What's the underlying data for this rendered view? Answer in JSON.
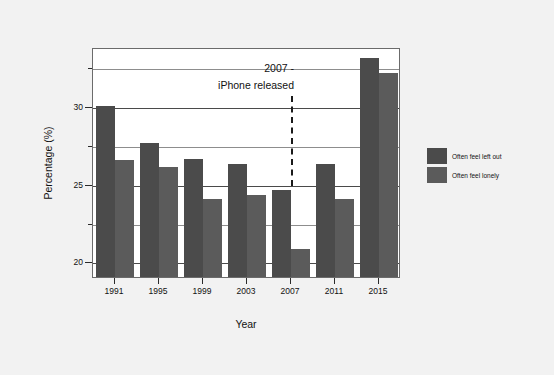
{
  "chart_data": {
    "type": "bar",
    "title": "",
    "xlabel": "Year",
    "ylabel": "Percentage (%)",
    "categories": [
      "1991",
      "1995",
      "1999",
      "2003",
      "2007",
      "2011",
      "2015"
    ],
    "series": [
      {
        "name": "Often feel left out",
        "color": "#4b4b4b",
        "values": [
          30.0,
          27.6,
          26.6,
          26.3,
          24.6,
          26.3,
          33.1
        ]
      },
      {
        "name": "Often feel lonely",
        "color": "#5b5b5b",
        "values": [
          26.5,
          26.1,
          24.0,
          24.3,
          20.8,
          24.0,
          32.1
        ]
      }
    ],
    "ylim": [
      19.0,
      33.8
    ],
    "ytick_labels": [
      "20",
      "25",
      "30"
    ],
    "ytick_values": [
      20,
      25,
      30
    ],
    "yminor_values": [
      22.5,
      27.5,
      32.5
    ],
    "xlim_grid": true,
    "grid": true,
    "legend_position": "right"
  },
  "annotation": {
    "line1": "2007 -",
    "line2": "iPhone released",
    "marker_year": "2007",
    "style": "dashed-vertical-line"
  },
  "legend": {
    "items": [
      {
        "label": "Often feel left out",
        "color": "#4b4b4b"
      },
      {
        "label": "Often feel lonely",
        "color": "#5b5b5b"
      }
    ]
  },
  "figure": {
    "background_color": "#f2f2f2",
    "plot_background_color": "#ffffff",
    "frame_color": "#6b6b6b"
  }
}
